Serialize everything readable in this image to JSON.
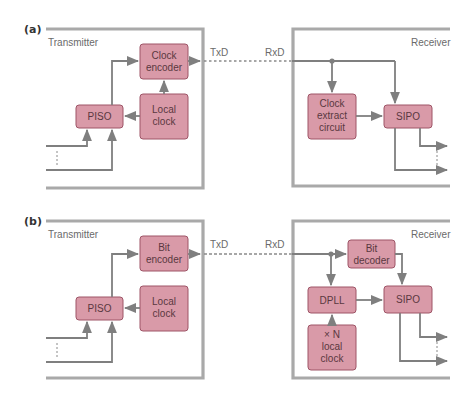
{
  "colors": {
    "block_fill": "#d99aa8",
    "block_stroke": "#9e5567",
    "frame": "#a9a9a9",
    "wire": "#7f7f7f",
    "label_text": "#6a6a6a"
  },
  "panel_a": {
    "tag": "(a)",
    "transmitter": {
      "title": "Transmitter",
      "blocks": {
        "encoder": [
          "Clock",
          "encoder"
        ],
        "local_clock": [
          "Local",
          "clock"
        ],
        "piso": [
          "PISO"
        ]
      },
      "tx_label": "TxD"
    },
    "receiver": {
      "title": "Receiver",
      "rx_label": "RxD",
      "blocks": {
        "clock_extract": [
          "Clock",
          "extract",
          "circuit"
        ],
        "sipo": [
          "SIPO"
        ]
      }
    }
  },
  "panel_b": {
    "tag": "(b)",
    "transmitter": {
      "title": "Transmitter",
      "blocks": {
        "encoder": [
          "Bit",
          "encoder"
        ],
        "local_clock": [
          "Local",
          "clock"
        ],
        "piso": [
          "PISO"
        ]
      },
      "tx_label": "TxD"
    },
    "receiver": {
      "title": "Receiver",
      "rx_label": "RxD",
      "blocks": {
        "bit_decoder": [
          "Bit",
          "decoder"
        ],
        "dpll": [
          "DPLL"
        ],
        "sipo": [
          "SIPO"
        ],
        "xn_clock": [
          "× N",
          "local",
          "clock"
        ]
      }
    }
  }
}
